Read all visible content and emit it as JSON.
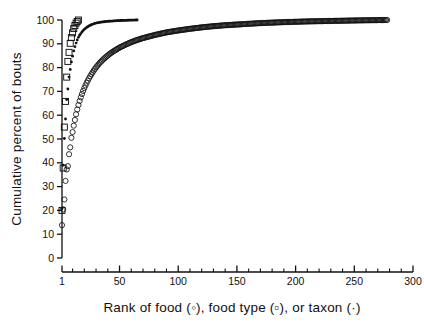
{
  "figure": {
    "background_color": "#ffffff",
    "ink_color": "#111111"
  },
  "axes": {
    "y_title": "Cumulative percent of bouts",
    "x_title_parts": {
      "p1": "Rank of food (",
      "sym1": "◦",
      "p2": "),  food type (",
      "sym2": "▫",
      "p3": "), or taxon (",
      "sym3": "·",
      "p4": ")"
    },
    "x_title_plain": "Rank of food (◦),  food type (▫), or taxon (·)",
    "y_ticks": [
      "0",
      "10",
      "20",
      "30",
      "40",
      "50",
      "60",
      "70",
      "80",
      "90",
      "100"
    ],
    "x_ticks": [
      "1",
      "50",
      "100",
      "150",
      "200",
      "250",
      "300"
    ]
  },
  "chart_data": {
    "type": "line",
    "title": "",
    "xlabel": "Rank of food (◦),  food type (▫), or taxon (·)",
    "ylabel": "Cumulative percent of bouts",
    "xlim": [
      1,
      300
    ],
    "ylim": [
      0,
      100
    ],
    "xticks": [
      1,
      50,
      100,
      150,
      200,
      250,
      300
    ],
    "yticks": [
      0,
      10,
      20,
      30,
      40,
      50,
      60,
      70,
      80,
      90,
      100
    ],
    "x_minor_tick_interval": 10,
    "y_minor_ticks": false,
    "grid": false,
    "legend": "inline-in-axis-label",
    "series": [
      {
        "name": "food",
        "marker": "open-circle",
        "marker_size": 2.6,
        "n_points": 278,
        "x": [
          1,
          2,
          3,
          4,
          5,
          6,
          7,
          8,
          9,
          10,
          11,
          12,
          13,
          14,
          15,
          16,
          17,
          18,
          19,
          20,
          22,
          24,
          26,
          28,
          30,
          33,
          36,
          39,
          42,
          45,
          50,
          55,
          60,
          65,
          70,
          80,
          90,
          100,
          110,
          120,
          130,
          140,
          150,
          160,
          170,
          180,
          190,
          200,
          210,
          220,
          230,
          240,
          250,
          260,
          270,
          278
        ],
        "y": [
          13.8,
          20.4,
          24.6,
          32.4,
          37.2,
          38.6,
          43.6,
          46.5,
          50.5,
          52.9,
          55.6,
          58.0,
          60.4,
          62.4,
          64.3,
          66.0,
          67.5,
          68.9,
          70.2,
          71.4,
          73.6,
          75.5,
          77.2,
          78.7,
          80.1,
          81.9,
          83.4,
          84.7,
          85.9,
          86.9,
          88.4,
          89.6,
          90.7,
          91.6,
          92.4,
          93.7,
          94.8,
          95.6,
          96.3,
          96.9,
          97.4,
          97.8,
          98.1,
          98.4,
          98.7,
          98.9,
          99.1,
          99.25,
          99.4,
          99.5,
          99.6,
          99.7,
          99.8,
          99.88,
          99.95,
          100.0
        ]
      },
      {
        "name": "food type",
        "marker": "open-square",
        "marker_size": 3.0,
        "n_points": 15,
        "x": [
          1,
          2,
          3,
          4,
          5,
          6,
          7,
          8,
          9,
          10,
          11,
          12,
          13,
          14,
          15
        ],
        "y": [
          20.0,
          37.8,
          55.0,
          65.8,
          76.0,
          82.6,
          86.4,
          90.2,
          92.6,
          94.6,
          96.4,
          97.7,
          98.7,
          99.4,
          100.0
        ]
      },
      {
        "name": "taxon",
        "marker": "small-dot",
        "marker_size": 1.4,
        "n_points": 65,
        "x": [
          1,
          2,
          3,
          4,
          5,
          6,
          7,
          8,
          9,
          10,
          11,
          12,
          13,
          14,
          15,
          16,
          18,
          20,
          22,
          24,
          26,
          28,
          30,
          33,
          36,
          39,
          42,
          45,
          48,
          51,
          54,
          57,
          60,
          62,
          64,
          65
        ],
        "y": [
          20.8,
          39.0,
          50.2,
          58.4,
          66.6,
          71.0,
          76.0,
          79.2,
          82.4,
          84.8,
          87.0,
          88.8,
          90.3,
          91.6,
          92.7,
          93.6,
          95.0,
          96.1,
          96.9,
          97.5,
          98.0,
          98.4,
          98.7,
          99.0,
          99.2,
          99.4,
          99.5,
          99.6,
          99.7,
          99.78,
          99.84,
          99.9,
          99.94,
          99.97,
          99.99,
          100.0
        ]
      }
    ]
  }
}
